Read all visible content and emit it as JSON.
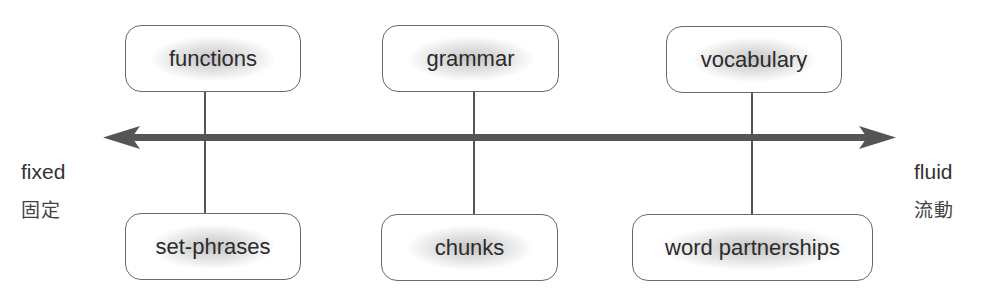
{
  "diagram": {
    "type": "continuum",
    "axis": {
      "direction": "bidirectional",
      "color": "#555555",
      "left_end": {
        "label": "fixed",
        "label_cjk": "固定"
      },
      "right_end": {
        "label": "fluid",
        "label_cjk": "流動"
      }
    },
    "columns": [
      {
        "top": "functions",
        "bottom": "set-phrases"
      },
      {
        "top": "grammar",
        "bottom": "chunks"
      },
      {
        "top": "vocabulary",
        "bottom": "word partnerships"
      }
    ]
  }
}
